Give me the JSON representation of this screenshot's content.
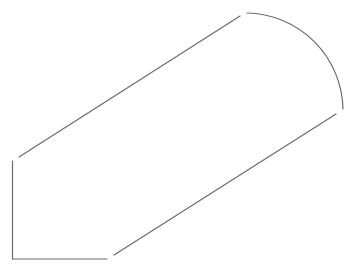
{
  "diagram": {
    "title": "",
    "canvas": {
      "width": 355,
      "height": 273,
      "background": "#ffffff"
    },
    "stroke": {
      "color": "#6b6b6b",
      "width": 1.2
    },
    "segments": [
      {
        "id": "left-vertical",
        "type": "line",
        "x1": 12.5,
        "y1": 161,
        "x2": 12.5,
        "y2": 259
      },
      {
        "id": "bottom-horizontal",
        "type": "line",
        "x1": 12.5,
        "y1": 259,
        "x2": 107,
        "y2": 259
      },
      {
        "id": "lower-diagonal",
        "type": "line",
        "x1": 114,
        "y1": 255,
        "x2": 336,
        "y2": 114
      },
      {
        "id": "upper-diagonal",
        "type": "line",
        "x1": 19,
        "y1": 157,
        "x2": 240,
        "y2": 16
      },
      {
        "id": "end-arc",
        "type": "arc",
        "x1": 247,
        "y1": 13,
        "x2": 343,
        "y2": 109,
        "rx": 98,
        "ry": 98
      }
    ]
  }
}
